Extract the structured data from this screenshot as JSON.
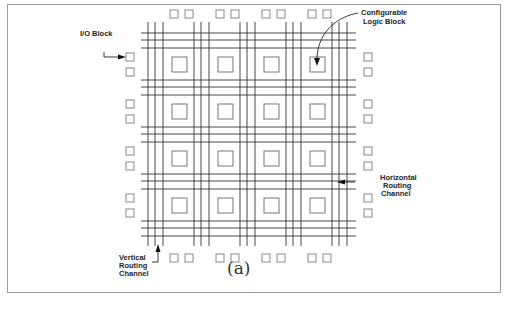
{
  "figure": {
    "caption": "(a)",
    "labels": {
      "io_block": "I/O Block",
      "clb_line1": "Configurable",
      "clb_line2": "Logic Block",
      "hrc_line1": "Horizontal",
      "hrc_line2": "Routing",
      "hrc_line3": "Channel",
      "vrc_line1": "Vertical",
      "vrc_line2": "Routing",
      "vrc_line3": "Channel"
    },
    "grid": {
      "rows": 4,
      "cols": 4,
      "tracks_per_channel": 3,
      "io_blocks_per_side": 8
    },
    "colors": {
      "line": "#333333",
      "block": "#777777",
      "border": "#9a9a9a"
    }
  }
}
